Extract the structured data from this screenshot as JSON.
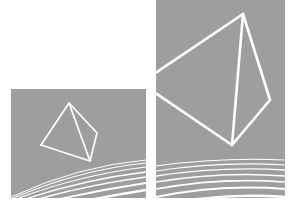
{
  "canvas": {
    "width": 294,
    "height": 210,
    "background_color": "#ffffff",
    "title": "two-panel-wireframe-tetrahedron-render"
  },
  "palette": {
    "panel_gray": "#9e9e9e",
    "wireframe_white": "#ffffff",
    "ground_line_white": "#ffffff",
    "page_white": "#ffffff"
  },
  "panels": [
    {
      "id": "left-panel",
      "label": "Left viewport",
      "x": 11,
      "y": 89,
      "width": 135,
      "height": 109,
      "fill": "#9e9e9e"
    },
    {
      "id": "right-panel",
      "label": "Right viewport",
      "x": 156,
      "y": 0,
      "width": 129,
      "height": 198,
      "fill": "#9e9e9e"
    }
  ],
  "wireframes": [
    {
      "id": "left-tetrahedron",
      "label": "Small tetrahedron wireframe",
      "stroke": "#ffffff",
      "stroke_width": 1.7,
      "vertices": {
        "apex": [
          69,
          103
        ],
        "left": [
          41,
          145
        ],
        "bottom": [
          90,
          161
        ],
        "right": [
          97,
          133
        ]
      },
      "edges": [
        [
          "apex",
          "left"
        ],
        [
          "apex",
          "bottom"
        ],
        [
          "apex",
          "right"
        ],
        [
          "left",
          "bottom"
        ],
        [
          "bottom",
          "right"
        ]
      ]
    },
    {
      "id": "right-tetrahedron",
      "label": "Large tetrahedron wireframe",
      "stroke": "#ffffff",
      "stroke_width": 2.6,
      "vertices": {
        "apex": [
          243,
          14
        ],
        "left_upper": [
          154,
          74
        ],
        "left_lower": [
          154,
          92
        ],
        "bottom": [
          232,
          145
        ],
        "right": [
          270,
          100
        ]
      },
      "edges": [
        [
          "apex",
          "left_upper"
        ],
        [
          "apex",
          "bottom"
        ],
        [
          "apex",
          "right"
        ],
        [
          "left_lower",
          "bottom"
        ],
        [
          "bottom",
          "right"
        ]
      ]
    }
  ],
  "ground_grids": [
    {
      "id": "left-ground-grid",
      "label": "Left panel perspective ground lines",
      "stroke": "#ffffff",
      "line_count": 7,
      "stroke_widths": [
        1.0,
        1.1,
        1.2,
        1.4,
        1.6,
        1.9,
        2.3
      ],
      "curve_paths": [
        "M 11 197 Q 78 166 146 160",
        "M 11 199 Q 78 170 146 163",
        "M 11 201 Q 78 175 146 167",
        "M 11 204 Q 78 180 146 172",
        "M 11 207 Q 78 186 146 177",
        "M 11 211 Q 78 193 146 183",
        "M 11 216 Q 78 201 146 190"
      ]
    },
    {
      "id": "right-ground-grid",
      "label": "Right panel perspective ground lines",
      "stroke": "#ffffff",
      "line_count": 7,
      "stroke_widths": [
        1.1,
        1.2,
        1.3,
        1.5,
        1.7,
        2.0,
        2.4
      ],
      "curve_paths": [
        "M 156 166 Q 221 157 285 160",
        "M 156 171 Q 221 161 285 165",
        "M 156 176 Q 221 166 285 170",
        "M 156 182 Q 221 171 285 176",
        "M 156 189 Q 221 177 285 182",
        "M 156 197 Q 221 184 285 189",
        "M 156 206 Q 221 192 285 197"
      ]
    }
  ]
}
